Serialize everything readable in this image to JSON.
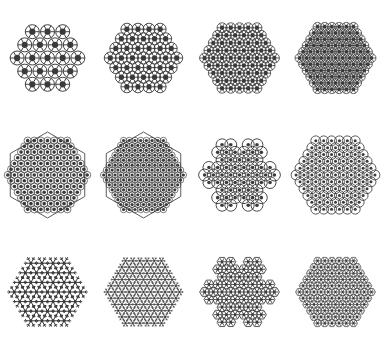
{
  "figure": {
    "title": "",
    "background_color": "#ffffff",
    "stroke_color": "#333333",
    "fill_color": "#3a3a3a",
    "layout": {
      "rows": 3,
      "columns": 4,
      "width": 383,
      "height": 350
    }
  },
  "chart_data": {
    "type": "diagram",
    "title": "",
    "rows": 3,
    "columns": 4,
    "panels": [
      {
        "index": 1,
        "row": 1,
        "column": 1,
        "shape": "hexagon",
        "motif": "ring-rosette",
        "iteration": 1,
        "ring_count": 19,
        "density": 0.35,
        "ring_radius": 7,
        "outline_visible": false,
        "label": ""
      },
      {
        "index": 2,
        "row": 1,
        "column": 2,
        "shape": "hexagon",
        "motif": "ring-rosette",
        "iteration": 2,
        "ring_count": 37,
        "density": 0.5,
        "ring_radius": 6,
        "outline_visible": false,
        "label": ""
      },
      {
        "index": 3,
        "row": 1,
        "column": 3,
        "shape": "hexagon",
        "motif": "ring-rosette",
        "iteration": 3,
        "ring_count": 61,
        "density": 0.62,
        "ring_radius": 5,
        "outline_visible": false,
        "label": ""
      },
      {
        "index": 4,
        "row": 1,
        "column": 4,
        "shape": "hexagon",
        "motif": "ring-rosette",
        "iteration": 4,
        "ring_count": 91,
        "density": 0.72,
        "ring_radius": 4.5,
        "outline_visible": false,
        "label": ""
      },
      {
        "index": 5,
        "row": 2,
        "column": 1,
        "shape": "hexagon",
        "motif": "dense-lattice",
        "iteration": 5,
        "ring_count": 127,
        "density": 0.85,
        "ring_radius": 3.6,
        "outline_visible": true,
        "label": ""
      },
      {
        "index": 6,
        "row": 2,
        "column": 2,
        "shape": "hexagon",
        "motif": "dense-lattice",
        "iteration": 6,
        "ring_count": 169,
        "density": 0.88,
        "ring_radius": 3.2,
        "outline_visible": true,
        "label": ""
      },
      {
        "index": 7,
        "row": 2,
        "column": 3,
        "shape": "snowflake",
        "motif": "curl-lattice",
        "iteration": 7,
        "ring_count": 60,
        "density": 0.45,
        "ring_radius": 6,
        "outline_visible": false,
        "label": ""
      },
      {
        "index": 8,
        "row": 2,
        "column": 4,
        "shape": "hexagon",
        "motif": "curl-lattice",
        "iteration": 8,
        "ring_count": 85,
        "density": 0.6,
        "ring_radius": 5,
        "outline_visible": false,
        "label": ""
      },
      {
        "index": 9,
        "row": 3,
        "column": 1,
        "shape": "snowflake",
        "motif": "star-flake",
        "iteration": 9,
        "ring_count": 31,
        "density": 0.3,
        "ring_radius": 7,
        "outline_visible": false,
        "label": ""
      },
      {
        "index": 10,
        "row": 3,
        "column": 2,
        "shape": "hexagon",
        "motif": "star-flake",
        "iteration": 10,
        "ring_count": 96,
        "density": 0.8,
        "ring_radius": 4,
        "outline_visible": false,
        "label": ""
      },
      {
        "index": 11,
        "row": 3,
        "column": 3,
        "shape": "snowflake",
        "motif": "branch-lattice",
        "iteration": 11,
        "ring_count": 72,
        "density": 0.55,
        "ring_radius": 5,
        "outline_visible": false,
        "label": ""
      },
      {
        "index": 12,
        "row": 3,
        "column": 4,
        "shape": "hexagon",
        "motif": "branch-lattice",
        "iteration": 12,
        "ring_count": 110,
        "density": 0.78,
        "ring_radius": 4,
        "outline_visible": false,
        "label": ""
      }
    ]
  }
}
